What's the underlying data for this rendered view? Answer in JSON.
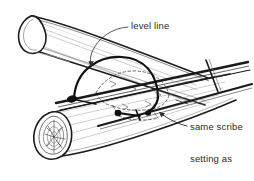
{
  "figure": {
    "type": "hand-drawn technical illustration",
    "background_color": "#ffffff",
    "ink_color": "#1a1a1a",
    "shade_color": "#8d8d8d",
    "text_color": "#2b2b2b"
  },
  "annotations": {
    "level_line": {
      "label": "level line",
      "leader": "curved leader with arrowhead pointing down-left to the level straightedge"
    },
    "same_scribe": {
      "line1": "same scribe",
      "line2": "setting as",
      "line3": "notch",
      "leader": "two straight leaders pointing left to the dashed notch outline and the scribe compass"
    }
  },
  "objects": {
    "upper_log": {
      "name": "upper-log",
      "description": "large cylindrical log running from upper-left down to the right, open elliptical end at the upper left"
    },
    "lower_log": {
      "name": "lower-log",
      "description": "second log crossing beneath, end grain with concentric growth rings visible at lower left"
    },
    "level_straightedge": {
      "name": "level-straightedge",
      "description": "long thin straightedge bar laid across both logs with a short cross piece near the right end"
    },
    "scribe_compass": {
      "name": "scribe-compass",
      "description": "scribe drawn as a dark arc with solid pivot knobs at each leg end, spanning the upper log"
    },
    "notch_outline": {
      "name": "notch-outline",
      "description": "dashed saddle notch outline projected onto the log surface"
    },
    "end_grain_rings": {
      "name": "end-grain-rings",
      "description": "concentric annual rings with short radial checks on the lower log end"
    }
  }
}
